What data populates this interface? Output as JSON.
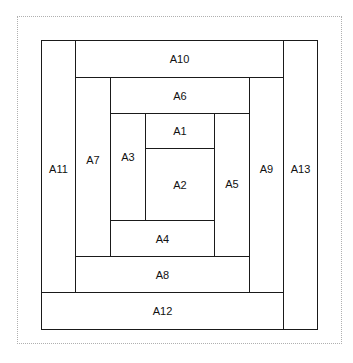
{
  "diagram": {
    "type": "log-cabin-block",
    "regions": [
      {
        "id": "A11",
        "label": "A11",
        "x": 41,
        "y": 40,
        "w": 35,
        "h": 253
      },
      {
        "id": "A10",
        "label": "A10",
        "x": 75,
        "y": 40,
        "w": 209,
        "h": 38
      },
      {
        "id": "A13",
        "label": "A13",
        "x": 283,
        "y": 40,
        "w": 35,
        "h": 290
      },
      {
        "id": "A7",
        "label": "A7",
        "x": 75,
        "y": 77,
        "w": 36,
        "h": 180
      },
      {
        "id": "A6",
        "label": "A6",
        "x": 110,
        "y": 77,
        "w": 140,
        "h": 37
      },
      {
        "id": "A9",
        "label": "A9",
        "x": 249,
        "y": 77,
        "w": 35,
        "h": 216
      },
      {
        "id": "A3",
        "label": "A3",
        "x": 110,
        "y": 113,
        "w": 36,
        "h": 108
      },
      {
        "id": "A1",
        "label": "A1",
        "x": 145,
        "y": 113,
        "w": 70,
        "h": 36
      },
      {
        "id": "A5",
        "label": "A5",
        "x": 214,
        "y": 113,
        "w": 36,
        "h": 144
      },
      {
        "id": "A2",
        "label": "A2",
        "x": 145,
        "y": 148,
        "w": 70,
        "h": 73
      },
      {
        "id": "A4",
        "label": "A4",
        "x": 110,
        "y": 220,
        "w": 105,
        "h": 37
      },
      {
        "id": "A8",
        "label": "A8",
        "x": 75,
        "y": 256,
        "w": 175,
        "h": 37
      },
      {
        "id": "A12",
        "label": "A12",
        "x": 41,
        "y": 292,
        "w": 243,
        "h": 38
      }
    ],
    "label_offsets": {
      "A3": -10
    },
    "colors": {
      "stroke": "#1a1a1a",
      "fill": "#ffffff",
      "frame": "#b0b0b0"
    }
  }
}
